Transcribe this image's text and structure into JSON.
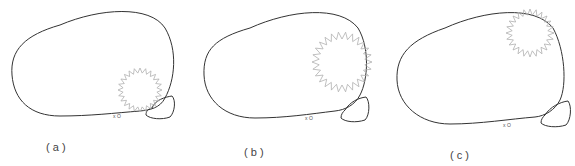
{
  "figure": {
    "panels": [
      {
        "id": "a",
        "caption": "( a )",
        "marker_label": "x O",
        "star": {
          "cx": 140,
          "cy": 90,
          "r_outer": 22,
          "r_inner": 17,
          "points": 24
        }
      },
      {
        "id": "b",
        "caption": "( b )",
        "marker_label": "x O",
        "star": {
          "cx": 342,
          "cy": 62,
          "r_outer": 30,
          "r_inner": 23,
          "points": 26
        }
      },
      {
        "id": "c",
        "caption": "( c )",
        "marker_label": "x O",
        "star": {
          "cx": 530,
          "cy": 33,
          "r_outer": 24,
          "r_inner": 18,
          "points": 24
        }
      }
    ],
    "colors": {
      "outline": "#333333",
      "star": "#b0b0b0"
    }
  }
}
